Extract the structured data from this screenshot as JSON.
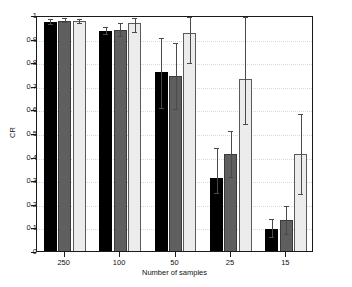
{
  "chart_data": {
    "type": "bar",
    "title": "",
    "xlabel": "Number of samples",
    "ylabel": "CR",
    "categories": [
      "250",
      "100",
      "50",
      "25",
      "15"
    ],
    "ylim": [
      0,
      1
    ],
    "yticks": [
      0,
      0.1,
      0.2,
      0.3,
      0.4,
      0.5,
      0.6,
      0.7,
      0.8,
      0.9,
      1
    ],
    "ytick_labels": [
      "0",
      "0.1",
      "0.2",
      "0.3",
      "0.4",
      "0.5",
      "0.6",
      "0.7",
      "0.8",
      "0.9",
      "1"
    ],
    "grid": true,
    "grid_style": "dotted-horizontal",
    "legend": "none",
    "error_bars": true,
    "series": [
      {
        "name": "series-1",
        "color": "#000000",
        "values": [
          0.98,
          0.94,
          0.765,
          0.318,
          0.102
        ],
        "err_low": [
          0.008,
          0.014,
          0.15,
          0.062,
          0.035
        ],
        "err_high": [
          0.01,
          0.016,
          0.148,
          0.128,
          0.042
        ]
      },
      {
        "name": "series-2",
        "color": "#5f5f5f",
        "values": [
          0.985,
          0.947,
          0.75,
          0.42,
          0.138
        ],
        "err_low": [
          0.008,
          0.028,
          0.138,
          0.098,
          0.058
        ],
        "err_high": [
          0.01,
          0.028,
          0.14,
          0.098,
          0.06
        ]
      },
      {
        "name": "series-3",
        "color": "#ececec",
        "values": [
          0.982,
          0.975,
          0.932,
          0.738,
          0.42
        ],
        "err_low": [
          0.009,
          0.038,
          0.125,
          0.193,
          0.168
        ],
        "err_high": [
          0.01,
          0.022,
          0.068,
          0.262,
          0.168
        ]
      }
    ]
  },
  "axis": {
    "ylabel_text": "CR",
    "xlabel_text": "Number of samples"
  }
}
